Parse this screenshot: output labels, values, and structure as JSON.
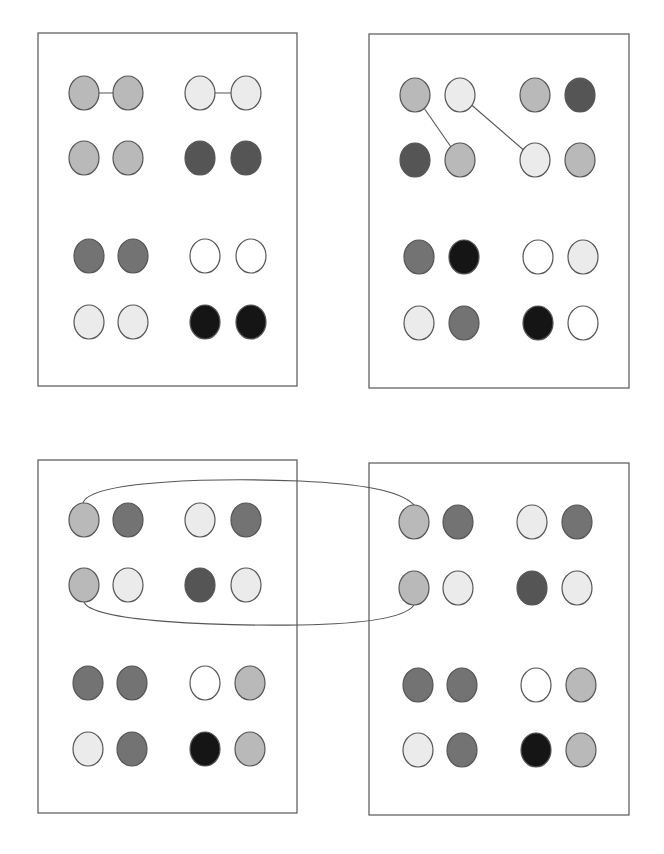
{
  "diagram": {
    "colors": {
      "white": "#ffffff",
      "very_light": "#ebebeb",
      "light": "#b9b9b9",
      "medium": "#737373",
      "dark": "#555555",
      "black": "#151515",
      "outline": "#555555"
    },
    "panels": [
      {
        "id": "top-left",
        "box": {
          "x": 38,
          "y": 33,
          "w": 259,
          "h": 353
        },
        "rows": [
          {
            "y": 93,
            "cols": [
              84,
              128,
              200,
              246
            ],
            "shades": [
              "light",
              "light",
              "very_light",
              "very_light"
            ]
          },
          {
            "y": 158,
            "cols": [
              84,
              128,
              200,
              246
            ],
            "shades": [
              "light",
              "light",
              "dark",
              "dark"
            ]
          },
          {
            "y": 256,
            "cols": [
              89,
              133,
              205,
              251
            ],
            "shades": [
              "medium",
              "medium",
              "white",
              "white"
            ]
          },
          {
            "y": 322,
            "cols": [
              89,
              133,
              205,
              251
            ],
            "shades": [
              "very_light",
              "very_light",
              "black",
              "black"
            ]
          }
        ],
        "links": [
          {
            "from": [
              0,
              0
            ],
            "to": [
              0,
              1
            ],
            "type": "straight"
          },
          {
            "from": [
              0,
              2
            ],
            "to": [
              0,
              3
            ],
            "type": "straight"
          }
        ]
      },
      {
        "id": "top-right",
        "box": {
          "x": 369,
          "y": 34,
          "w": 260,
          "h": 354
        },
        "rows": [
          {
            "y": 95,
            "cols": [
              415,
              460,
              535,
              580
            ],
            "shades": [
              "light",
              "very_light",
              "light",
              "dark"
            ]
          },
          {
            "y": 160,
            "cols": [
              415,
              460,
              535,
              580
            ],
            "shades": [
              "dark",
              "light",
              "very_light",
              "light"
            ]
          },
          {
            "y": 257,
            "cols": [
              419,
              464,
              538,
              583
            ],
            "shades": [
              "medium",
              "black",
              "white",
              "very_light"
            ]
          },
          {
            "y": 323,
            "cols": [
              419,
              464,
              538,
              583
            ],
            "shades": [
              "very_light",
              "medium",
              "black",
              "white"
            ]
          }
        ],
        "links": [
          {
            "from": [
              0,
              0
            ],
            "to": [
              1,
              1
            ],
            "type": "straight"
          },
          {
            "from": [
              0,
              1
            ],
            "to": [
              1,
              2
            ],
            "type": "straight"
          }
        ]
      },
      {
        "id": "bottom-left",
        "box": {
          "x": 38,
          "y": 460,
          "w": 259,
          "h": 353
        },
        "rows": [
          {
            "y": 520,
            "cols": [
              84,
              128,
              200,
              246
            ],
            "shades": [
              "light",
              "medium",
              "very_light",
              "medium"
            ]
          },
          {
            "y": 585,
            "cols": [
              84,
              128,
              200,
              246
            ],
            "shades": [
              "light",
              "very_light",
              "dark",
              "very_light"
            ]
          },
          {
            "y": 683,
            "cols": [
              88,
              132,
              205,
              250
            ],
            "shades": [
              "medium",
              "medium",
              "white",
              "light"
            ]
          },
          {
            "y": 749,
            "cols": [
              88,
              132,
              205,
              250
            ],
            "shades": [
              "very_light",
              "medium",
              "black",
              "light"
            ]
          }
        ],
        "links": []
      },
      {
        "id": "bottom-right",
        "box": {
          "x": 369,
          "y": 463,
          "w": 260,
          "h": 352
        },
        "rows": [
          {
            "y": 522,
            "cols": [
              414,
              458,
              532,
              577
            ],
            "shades": [
              "light",
              "medium",
              "very_light",
              "medium"
            ]
          },
          {
            "y": 588,
            "cols": [
              414,
              458,
              532,
              577
            ],
            "shades": [
              "light",
              "very_light",
              "dark",
              "very_light"
            ]
          },
          {
            "y": 685,
            "cols": [
              418,
              462,
              536,
              581
            ],
            "shades": [
              "medium",
              "medium",
              "white",
              "light"
            ]
          },
          {
            "y": 750,
            "cols": [
              418,
              462,
              536,
              581
            ],
            "shades": [
              "very_light",
              "medium",
              "black",
              "light"
            ]
          }
        ],
        "links": []
      }
    ],
    "cross_links": [
      {
        "description": "Elongated loop connecting the left column pair of bottom-left panel to the left column pair of bottom-right panel",
        "top_path": "M 83 503 C 90 480, 220 478, 300 481 C 360 484, 400 490, 414 505",
        "bottom_path": "M 84 602 C 92 622, 220 626, 300 625 C 360 624, 405 618, 414 605"
      }
    ],
    "circle_radius": {
      "rx": 15,
      "ry": 17
    }
  }
}
